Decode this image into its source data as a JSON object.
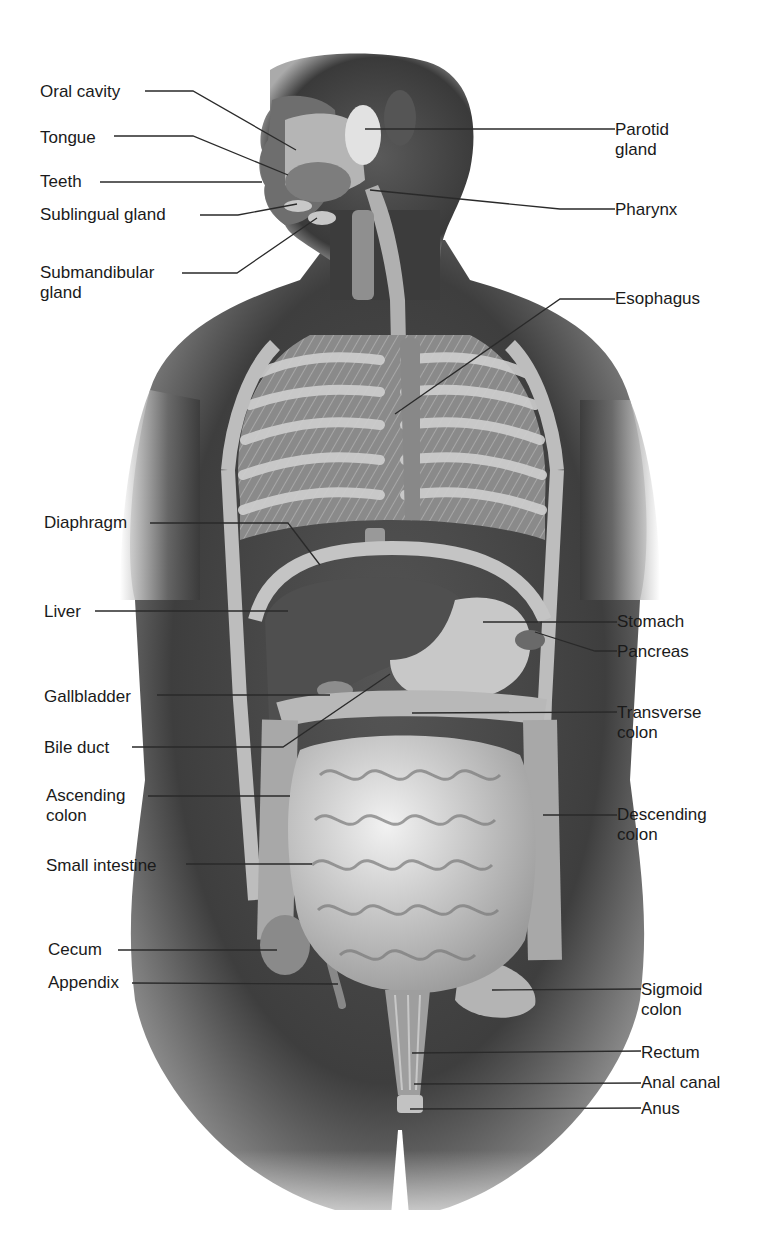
{
  "figure": {
    "style": "grayscale anatomical illustration"
  },
  "labels_left": [
    {
      "id": "oral-cavity",
      "text": "Oral cavity",
      "x": 40,
      "y": 82,
      "line": [
        [
          145,
          91
        ],
        [
          193,
          91
        ],
        [
          296,
          150
        ]
      ]
    },
    {
      "id": "tongue",
      "text": "Tongue",
      "x": 40,
      "y": 128,
      "line": [
        [
          114,
          136
        ],
        [
          193,
          136
        ],
        [
          288,
          175
        ]
      ]
    },
    {
      "id": "teeth",
      "text": "Teeth",
      "x": 40,
      "y": 172,
      "line": [
        [
          100,
          182
        ],
        [
          262,
          182
        ]
      ]
    },
    {
      "id": "sublingual-gland",
      "text": "Sublingual gland",
      "x": 40,
      "y": 205,
      "line": [
        [
          200,
          215
        ],
        [
          238,
          215
        ],
        [
          297,
          204
        ]
      ]
    },
    {
      "id": "submandibular-gland",
      "text": "Submandibular\ngland",
      "x": 40,
      "y": 263,
      "line": [
        [
          182,
          273
        ],
        [
          237,
          273
        ],
        [
          317,
          218
        ]
      ]
    },
    {
      "id": "diaphragm",
      "text": "Diaphragm",
      "x": 44,
      "y": 513,
      "line": [
        [
          150,
          523
        ],
        [
          288,
          523
        ],
        [
          320,
          565
        ]
      ]
    },
    {
      "id": "liver",
      "text": "Liver",
      "x": 44,
      "y": 602,
      "line": [
        [
          95,
          611
        ],
        [
          288,
          611
        ]
      ]
    },
    {
      "id": "gallbladder",
      "text": "Gallbladder",
      "x": 44,
      "y": 687,
      "line": [
        [
          157,
          695
        ],
        [
          330,
          695
        ]
      ]
    },
    {
      "id": "bile-duct",
      "text": "Bile duct",
      "x": 44,
      "y": 738,
      "line": [
        [
          132,
          747
        ],
        [
          283,
          747
        ],
        [
          390,
          674
        ]
      ]
    },
    {
      "id": "ascending-colon",
      "text": "Ascending\ncolon",
      "x": 46,
      "y": 786,
      "line": [
        [
          148,
          796
        ],
        [
          290,
          796
        ]
      ]
    },
    {
      "id": "small-intestine",
      "text": "Small intestine",
      "x": 46,
      "y": 856,
      "line": [
        [
          186,
          864
        ],
        [
          312,
          864
        ]
      ]
    },
    {
      "id": "cecum",
      "text": "Cecum",
      "x": 48,
      "y": 940,
      "line": [
        [
          118,
          950
        ],
        [
          277,
          950
        ]
      ]
    },
    {
      "id": "appendix",
      "text": "Appendix",
      "x": 48,
      "y": 973,
      "line": [
        [
          132,
          983
        ],
        [
          338,
          984
        ]
      ]
    }
  ],
  "labels_right": [
    {
      "id": "parotid-gland",
      "text": "Parotid\ngland",
      "x": 615,
      "y": 120,
      "line": [
        [
          365,
          129
        ],
        [
          615,
          129
        ]
      ]
    },
    {
      "id": "pharynx",
      "text": "Pharynx",
      "x": 615,
      "y": 200,
      "line": [
        [
          370,
          190
        ],
        [
          560,
          209
        ],
        [
          615,
          209
        ]
      ]
    },
    {
      "id": "esophagus",
      "text": "Esophagus",
      "x": 615,
      "y": 289,
      "line": [
        [
          395,
          414
        ],
        [
          560,
          299
        ],
        [
          615,
          299
        ]
      ]
    },
    {
      "id": "stomach",
      "text": "Stomach",
      "x": 617,
      "y": 612,
      "line": [
        [
          483,
          622
        ],
        [
          617,
          622
        ]
      ]
    },
    {
      "id": "pancreas",
      "text": "Pancreas",
      "x": 617,
      "y": 642,
      "line": [
        [
          535,
          632
        ],
        [
          595,
          651
        ],
        [
          617,
          651
        ]
      ]
    },
    {
      "id": "transverse-colon",
      "text": "Transverse\ncolon",
      "x": 617,
      "y": 703,
      "line": [
        [
          412,
          713
        ],
        [
          617,
          712
        ]
      ]
    },
    {
      "id": "descending-colon",
      "text": "Descending\ncolon",
      "x": 617,
      "y": 805,
      "line": [
        [
          543,
          815
        ],
        [
          617,
          815
        ]
      ]
    },
    {
      "id": "sigmoid-colon",
      "text": "Sigmoid\ncolon",
      "x": 641,
      "y": 980,
      "line": [
        [
          492,
          990
        ],
        [
          641,
          989
        ]
      ]
    },
    {
      "id": "rectum",
      "text": "Rectum",
      "x": 641,
      "y": 1043,
      "line": [
        [
          412,
          1053
        ],
        [
          641,
          1051
        ]
      ]
    },
    {
      "id": "anal-canal",
      "text": "Anal canal",
      "x": 641,
      "y": 1073,
      "line": [
        [
          414,
          1084
        ],
        [
          641,
          1083
        ]
      ]
    },
    {
      "id": "anus",
      "text": "Anus",
      "x": 641,
      "y": 1099,
      "line": [
        [
          410,
          1109
        ],
        [
          641,
          1108
        ]
      ]
    }
  ],
  "colors": {
    "background": "#ffffff",
    "skin_dark": "#3a3a3a",
    "skin_mid": "#6a6a6a",
    "organ_light": "#cfcfcf",
    "organ_mid": "#9a9a9a",
    "label_text": "#1a1a1a",
    "leader_line": "#2a2a2a"
  }
}
